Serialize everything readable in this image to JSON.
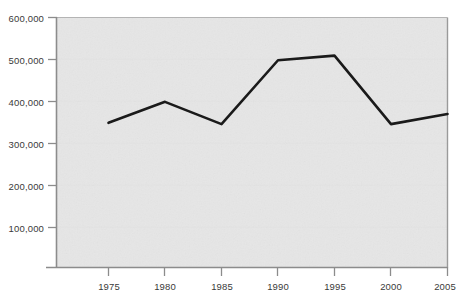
{
  "chart_data": {
    "type": "line",
    "title": "",
    "subtitle": "",
    "xlabel": "",
    "ylabel": "",
    "x": [
      1975,
      1980,
      1985,
      1990,
      1995,
      2000,
      2005
    ],
    "values": [
      348000,
      398000,
      345000,
      497000,
      508000,
      345000,
      369000
    ],
    "series": [
      {
        "name": "",
        "values": [
          348000,
          398000,
          345000,
          497000,
          508000,
          345000,
          369000
        ]
      }
    ],
    "xlim": [
      1975,
      2005
    ],
    "ylim": [
      0,
      600000
    ],
    "x_ticks": [
      "1975",
      "1980",
      "1985",
      "1990",
      "1995",
      "2000",
      "2005"
    ],
    "y_ticks": [
      "100,000",
      "200,000",
      "300,000",
      "400,000",
      "500,000",
      "600,000"
    ],
    "y_tick_values": [
      100000,
      200000,
      300000,
      400000,
      500000,
      600000
    ],
    "grid": false,
    "legend": "none",
    "line_color": "#1a1a1a",
    "plot_background": "#e6e6e6",
    "axis_color": "#808080",
    "text_color": "#3a3a3a"
  },
  "axes": {
    "y_ticks": [
      {
        "label": "600,000",
        "value": 600000
      },
      {
        "label": "500,000",
        "value": 500000
      },
      {
        "label": "400,000",
        "value": 400000
      },
      {
        "label": "300,000",
        "value": 300000
      },
      {
        "label": "200,000",
        "value": 200000
      },
      {
        "label": "100,000",
        "value": 100000
      }
    ],
    "x_ticks": [
      {
        "label": "1975",
        "value": 1975
      },
      {
        "label": "1980",
        "value": 1980
      },
      {
        "label": "1985",
        "value": 1985
      },
      {
        "label": "1990",
        "value": 1990
      },
      {
        "label": "1995",
        "value": 1995
      },
      {
        "label": "2000",
        "value": 2000
      },
      {
        "label": "2005",
        "value": 2005
      }
    ]
  }
}
